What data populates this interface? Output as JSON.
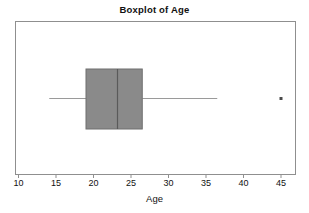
{
  "chart_data": {
    "type": "boxplot",
    "title": "Boxplot of Age",
    "xlabel": "Age",
    "ylabel": "",
    "orientation": "horizontal",
    "grid": false,
    "legend": null,
    "xlim": [
      9,
      47.5
    ],
    "xticks": [
      10,
      15,
      20,
      25,
      30,
      35,
      40,
      45
    ],
    "xticklabels": [
      "10",
      "15",
      "20",
      "25",
      "30",
      "35",
      "40",
      "45"
    ],
    "boxes": [
      {
        "name": "Age",
        "whisker_low": 14.1,
        "q1": 19.0,
        "median": 23.2,
        "q3": 26.5,
        "whisker_high": 36.5,
        "outliers": [
          45.0
        ]
      }
    ],
    "colors": {
      "box_fill": "#8a8a8a",
      "box_edge": "#6f6f6f",
      "median_line": "#5a5a5a",
      "whisker_line": "#9a9a9a",
      "outlier_marker": "#4a4a4a",
      "frame": "#8f8f8f",
      "text": "#111111",
      "background": "#ffffff"
    }
  }
}
